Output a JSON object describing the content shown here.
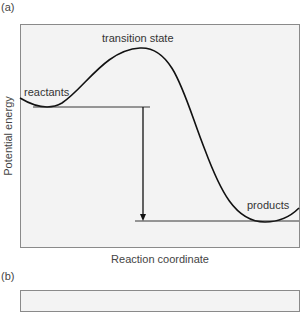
{
  "panels": {
    "a": {
      "label": "(a)"
    },
    "b": {
      "label": "(b)"
    }
  },
  "diagram": {
    "ylabel": "Potential energy",
    "xlabel": "Reaction coordinate",
    "annotations": {
      "transition_state": "transition state",
      "reactants": "reactants",
      "products": "products"
    },
    "colors": {
      "background": "#f3f3f3",
      "border": "#8a8a8a",
      "curve": "#111111"
    }
  }
}
